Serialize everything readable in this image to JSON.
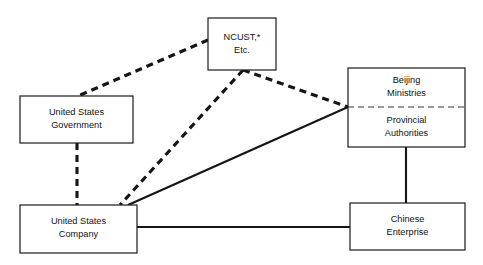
{
  "diagram": {
    "background_color": "#ffffff",
    "line_color": "#151515",
    "box_fill": "#ffffff",
    "box_stroke": "#1a1a1a",
    "nodes": [
      {
        "id": "ncust",
        "name": "ncust-box",
        "lines": [
          "NCUST,*",
          "Etc."
        ],
        "line1": "NCUST,*",
        "line2": "Etc.",
        "x": 208,
        "y": 18,
        "w": 68,
        "h": 52
      },
      {
        "id": "us-government",
        "name": "united-states-government-box",
        "lines": [
          "United States",
          "Government"
        ],
        "line1": "United States",
        "line2": "Government",
        "x": 20,
        "y": 96,
        "w": 113,
        "h": 47
      },
      {
        "id": "beijing-provincial",
        "name": "beijing-ministries-provincial-authorities-box",
        "lines": [
          "Beijing",
          "Ministries",
          "Provincial",
          "Authorities"
        ],
        "upper_line1": "Beijing",
        "upper_line2": "Ministries",
        "lower_line1": "Provincial",
        "lower_line2": "Authorities",
        "x": 348,
        "y": 68,
        "w": 117,
        "h": 79,
        "divider_y": 107,
        "divider_style": "dashed"
      },
      {
        "id": "us-company",
        "name": "united-states-company-box",
        "lines": [
          "United States",
          "Company"
        ],
        "line1": "United States",
        "line2": "Company",
        "x": 20,
        "y": 205,
        "w": 117,
        "h": 48
      },
      {
        "id": "chinese-enterprise",
        "name": "chinese-enterprise-box",
        "lines": [
          "Chinese",
          "Enterprise"
        ],
        "line1": "Chinese",
        "line2": "Enterprise",
        "x": 350,
        "y": 203,
        "w": 115,
        "h": 47
      }
    ],
    "edges": [
      {
        "id": "ncust-to-us-government",
        "name": "edge-ncust-to-us-government",
        "style": "dashed",
        "from": "ncust",
        "to": "us-government",
        "points": "208,40 78,96"
      },
      {
        "id": "ncust-to-beijing",
        "name": "edge-ncust-to-beijing-provincial",
        "style": "dashed",
        "from": "ncust",
        "to": "beijing-provincial",
        "points": "243,70 348,107"
      },
      {
        "id": "ncust-to-us-company",
        "name": "edge-ncust-to-us-company",
        "style": "dashed",
        "from": "ncust",
        "to": "us-company",
        "points": "243,70 120,205"
      },
      {
        "id": "us-government-to-us-company",
        "name": "edge-us-government-to-us-company",
        "style": "dashed",
        "from": "us-government",
        "to": "us-company",
        "points": "77,143 77,205"
      },
      {
        "id": "us-company-to-beijing",
        "name": "edge-us-company-to-beijing-provincial",
        "style": "solid",
        "from": "us-company",
        "to": "beijing-provincial",
        "points": "128,205 348,107"
      },
      {
        "id": "us-company-to-chinese-enterprise",
        "name": "edge-us-company-to-chinese-enterprise",
        "style": "solid",
        "from": "us-company",
        "to": "chinese-enterprise",
        "points": "137,227 350,227"
      },
      {
        "id": "beijing-to-chinese-enterprise",
        "name": "edge-beijing-provincial-to-chinese-enterprise",
        "style": "solid",
        "from": "beijing-provincial",
        "to": "chinese-enterprise",
        "points": "406,147 406,203"
      }
    ]
  }
}
